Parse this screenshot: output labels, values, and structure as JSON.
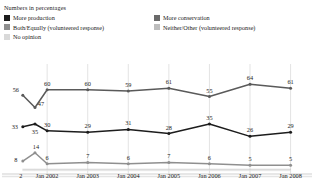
{
  "subtitle": "Numbers in percentages",
  "legend": {
    "rows": [
      [
        {
          "label": "More production",
          "color": "#1d1d1d",
          "key": "more_production"
        },
        {
          "label": "More conservation",
          "color": "#6a6a6a",
          "key": "more_conservation"
        }
      ],
      [
        {
          "label": "Both/Equally (volunteered response)",
          "color": "#8f8f8f",
          "key": "both_equally"
        },
        {
          "label": "Neither/Other (volunteered response)",
          "color": "#bdbdbd",
          "key": "neither_other"
        }
      ],
      [
        {
          "label": "No opinion",
          "color": "#d9d9d9",
          "key": "no_opinion"
        }
      ]
    ]
  },
  "chart_data": {
    "type": "line",
    "title": "Numbers in percentages",
    "xlabel": "",
    "ylabel": "",
    "ylim": [
      0,
      70
    ],
    "grid": "vertical-only",
    "legend_position": "top",
    "x": [
      "",
      "",
      "Jan 2002",
      "Jan 2003",
      "Jan 2004",
      "Jan 2005",
      "Jan 2006",
      "Jan 2007",
      "Jan 2008"
    ],
    "tick_labels": [
      "Jan 2002",
      "Jan 2003",
      "Jan 2004",
      "Jan 2005",
      "Jan 2006",
      "Jan 2007",
      "Jan 2008"
    ],
    "series": [
      {
        "name": "More conservation",
        "color": "#5a5a5a",
        "values": [
          56,
          47,
          60,
          60,
          59,
          61,
          55,
          64,
          61
        ],
        "labels": [
          "56",
          "47",
          "60",
          "60",
          "59",
          "61",
          "55",
          "64",
          "61"
        ]
      },
      {
        "name": "More production",
        "color": "#1d1d1d",
        "values": [
          33,
          35,
          30,
          29,
          31,
          28,
          35,
          26,
          29
        ],
        "labels": [
          "33",
          "35",
          "30",
          "29",
          "31",
          "28",
          "35",
          "26",
          "29"
        ]
      },
      {
        "name": "Both/Equally (volunteered response)",
        "color": "#8f8f8f",
        "values": [
          8,
          14,
          6,
          7,
          6,
          7,
          6,
          5,
          5
        ],
        "labels": [
          "8",
          "14",
          "6",
          "7",
          "6",
          "7",
          "6",
          "5",
          "5"
        ]
      },
      {
        "name": "Neither/Other (volunteered response)",
        "color": "#c4c4c4",
        "values": [
          2,
          2,
          2,
          2,
          2,
          2,
          2,
          2,
          2
        ],
        "labels": [
          "2",
          "",
          "",
          "",
          "",
          "",
          "",
          "",
          ""
        ]
      },
      {
        "name": "No opinion",
        "color": "#dcdcdc",
        "values": [
          1,
          1,
          1,
          1,
          1,
          1,
          1,
          1,
          1
        ],
        "labels": [
          "",
          "",
          "",
          "",
          "",
          "",
          "",
          "",
          ""
        ]
      }
    ]
  }
}
